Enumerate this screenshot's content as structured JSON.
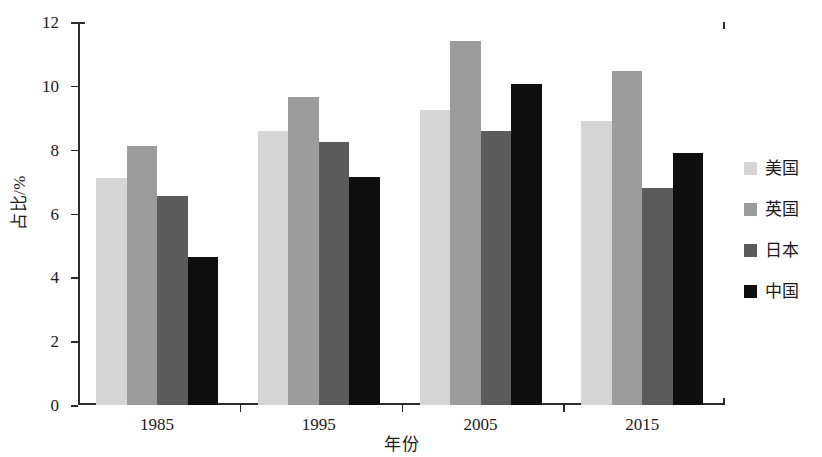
{
  "chart_data": {
    "type": "bar",
    "title": "",
    "subtitle": "",
    "xlabel": "年份",
    "ylabel": "占比/%",
    "categories": [
      "1985",
      "1995",
      "2005",
      "2015"
    ],
    "series": [
      {
        "name": "美国",
        "color": "#d5d5d5",
        "values": [
          7.1,
          8.6,
          9.25,
          8.9
        ]
      },
      {
        "name": "英国",
        "color": "#9c9c9c",
        "values": [
          8.1,
          9.65,
          11.4,
          10.45
        ]
      },
      {
        "name": "日本",
        "color": "#5b5b5b",
        "values": [
          6.55,
          8.25,
          8.6,
          6.8
        ]
      },
      {
        "name": "中国",
        "color": "#100f0f",
        "values": [
          4.65,
          7.15,
          10.05,
          7.9
        ]
      }
    ],
    "ylim": [
      0,
      12
    ],
    "yticks": [
      0,
      2,
      4,
      6,
      8,
      10,
      12
    ],
    "ytick_labels": [
      "0",
      "2",
      "4",
      "6",
      "8",
      "10",
      "12"
    ],
    "xtick_labels": [
      "1985",
      "1995",
      "2005",
      "2015"
    ],
    "grid": false,
    "legend_position": "right",
    "legend_entries": [
      "美国",
      "英国",
      "日本",
      "中国"
    ],
    "axis_color": "#2b2b2b",
    "background_color": "#ffffff"
  }
}
